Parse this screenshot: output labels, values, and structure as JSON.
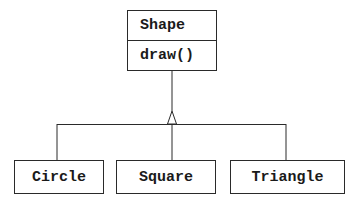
{
  "diagram": {
    "type": "uml-class-inheritance",
    "parent": {
      "name": "Shape",
      "methods": [
        "draw()"
      ]
    },
    "children": [
      {
        "name": "Circle"
      },
      {
        "name": "Square"
      },
      {
        "name": "Triangle"
      }
    ],
    "relationship": "generalization",
    "colors": {
      "line": "#2a2a2a",
      "text": "#1a1a1a",
      "background": "#ffffff"
    }
  }
}
